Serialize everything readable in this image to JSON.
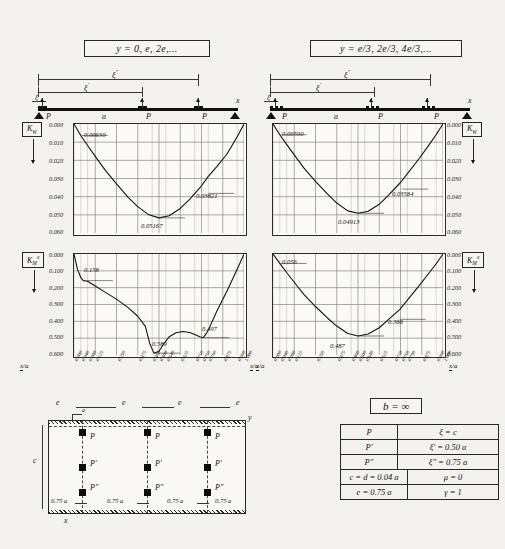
{
  "panels": {
    "left": {
      "title": "y = 0, e, 2e,...",
      "beam_span_label": "a",
      "x_axis_label": "x",
      "dims": [
        "ξ",
        "ξ'",
        "ξ\""
      ],
      "loads": [
        "P",
        "P",
        "P"
      ]
    },
    "right": {
      "title": "y = e/3, 2e/3, 4e/3,...",
      "beam_span_label": "a",
      "x_axis_label": "x",
      "dims": [
        "ξ",
        "ξ'",
        "ξ\""
      ],
      "loads": [
        "P",
        "P",
        "P"
      ]
    }
  },
  "axis": {
    "x_label": "x/a",
    "x_ticks": [
      "0.000",
      "0.040",
      "0.080",
      "0.125",
      "0.250",
      "0.375",
      "0.460",
      "0.500",
      "0.540",
      "0.625",
      "0.710",
      "0.750",
      "0.790",
      "0.875",
      "0.960",
      "1.000"
    ],
    "x_major": [
      "0.125",
      "0.250",
      "0.375",
      "0.500",
      "0.625",
      "0.750",
      "0.875",
      "1.000"
    ],
    "kw_ticks": [
      "0.000",
      "0.010",
      "0.020",
      "0.030",
      "0.040",
      "0.050",
      "0.060"
    ],
    "km_ticks": [
      "0.000",
      "0.100",
      "0.200",
      "0.300",
      "0.400",
      "0.500",
      "0.600"
    ]
  },
  "keys": {
    "kw": "K",
    "kw_sub": "W",
    "km": "K",
    "km_sub": "M",
    "km_sup": "x"
  },
  "chart_data": [
    {
      "type": "line",
      "id": "kw-left",
      "title": "K_W  for  y = 0, e, 2e,...",
      "xlabel": "x/a",
      "ylabel": "K_W",
      "xlim": [
        0.0,
        1.0
      ],
      "ylim": [
        0.0,
        0.06
      ],
      "y_inverted": true,
      "grid": true,
      "annotations": [
        {
          "label": "0.00630",
          "x": 0.045,
          "y": 0.0063
        },
        {
          "label": "0.05167",
          "x": 0.5,
          "y": 0.05167
        },
        {
          "label": "0.03821",
          "x": 0.79,
          "y": 0.03821
        }
      ],
      "x": [
        0.0,
        0.04,
        0.08,
        0.125,
        0.18,
        0.25,
        0.32,
        0.375,
        0.44,
        0.5,
        0.56,
        0.625,
        0.68,
        0.75,
        0.79,
        0.84,
        0.9,
        0.96,
        1.0
      ],
      "values": [
        0.0,
        0.0063,
        0.0118,
        0.0178,
        0.025,
        0.033,
        0.0405,
        0.0455,
        0.05,
        0.05167,
        0.0505,
        0.0465,
        0.0415,
        0.034,
        0.0288,
        0.0235,
        0.0165,
        0.007,
        0.0
      ]
    },
    {
      "type": "line",
      "id": "kw-right",
      "title": "K_W  for  y = e/3, 2e/3, 4e/3,...",
      "xlabel": "x/a",
      "ylabel": "K_W",
      "xlim": [
        0.0,
        1.0
      ],
      "ylim": [
        0.0,
        0.06
      ],
      "y_inverted": true,
      "grid": true,
      "annotations": [
        {
          "label": "0.00590",
          "x": 0.045,
          "y": 0.0059
        },
        {
          "label": "0.04913",
          "x": 0.5,
          "y": 0.04913
        },
        {
          "label": "0.03584",
          "x": 0.76,
          "y": 0.03584
        }
      ],
      "x": [
        0.0,
        0.04,
        0.08,
        0.125,
        0.18,
        0.25,
        0.32,
        0.375,
        0.44,
        0.5,
        0.56,
        0.625,
        0.68,
        0.75,
        0.8,
        0.86,
        0.92,
        0.96,
        1.0
      ],
      "values": [
        0.0,
        0.0059,
        0.0112,
        0.017,
        0.024,
        0.0316,
        0.0385,
        0.0435,
        0.0478,
        0.04913,
        0.048,
        0.0442,
        0.0392,
        0.0322,
        0.0262,
        0.019,
        0.0112,
        0.0058,
        0.0
      ]
    },
    {
      "type": "line",
      "id": "km-left",
      "title": "K_M^x  for  y = 0, e, 2e,...",
      "xlabel": "x/a",
      "ylabel": "K_M^x",
      "xlim": [
        0.0,
        1.0
      ],
      "ylim": [
        0.0,
        0.6
      ],
      "y_inverted": true,
      "grid": true,
      "annotations": [
        {
          "label": "0.158",
          "x": 0.075,
          "y": 0.158
        },
        {
          "label": "0.589",
          "x": 0.47,
          "y": 0.589
        },
        {
          "label": "0.497",
          "x": 0.76,
          "y": 0.497
        }
      ],
      "x": [
        0.0,
        0.02,
        0.04,
        0.055,
        0.08,
        0.125,
        0.18,
        0.25,
        0.32,
        0.375,
        0.42,
        0.445,
        0.47,
        0.5,
        0.53,
        0.56,
        0.6,
        0.64,
        0.68,
        0.71,
        0.74,
        0.76,
        0.78,
        0.8,
        0.84,
        0.9,
        0.96,
        1.0
      ],
      "values": [
        0.0,
        0.09,
        0.14,
        0.158,
        0.162,
        0.19,
        0.225,
        0.268,
        0.32,
        0.37,
        0.43,
        0.53,
        0.589,
        0.578,
        0.53,
        0.492,
        0.468,
        0.46,
        0.466,
        0.478,
        0.492,
        0.497,
        0.47,
        0.43,
        0.34,
        0.22,
        0.09,
        0.0
      ]
    },
    {
      "type": "line",
      "id": "km-right",
      "title": "K_M^x  for  y = e/3, 2e/3, 4e/3,...",
      "xlabel": "x/a",
      "ylabel": "K_M^x",
      "xlim": [
        0.0,
        1.0
      ],
      "ylim": [
        0.0,
        0.6
      ],
      "y_inverted": true,
      "grid": true,
      "annotations": [
        {
          "label": "0.056",
          "x": 0.045,
          "y": 0.056
        },
        {
          "label": "0.487",
          "x": 0.5,
          "y": 0.487
        },
        {
          "label": "0.388",
          "x": 0.745,
          "y": 0.388
        }
      ],
      "x": [
        0.0,
        0.04,
        0.08,
        0.125,
        0.18,
        0.25,
        0.32,
        0.375,
        0.44,
        0.5,
        0.56,
        0.625,
        0.68,
        0.745,
        0.8,
        0.86,
        0.92,
        0.96,
        1.0
      ],
      "values": [
        0.0,
        0.056,
        0.11,
        0.168,
        0.238,
        0.312,
        0.38,
        0.428,
        0.472,
        0.487,
        0.475,
        0.438,
        0.388,
        0.33,
        0.262,
        0.188,
        0.11,
        0.058,
        0.0
      ]
    }
  ],
  "plan": {
    "spacing_labels": [
      "e",
      "e",
      "e",
      "e"
    ],
    "offset_label": "a",
    "side_label": "c",
    "axis_label": "y",
    "bottom_axis_label": "x",
    "dim_labels": [
      "0.75 a",
      "0.75 a",
      "0.75 a",
      "0.75 a"
    ],
    "load_rows": [
      [
        "P",
        "P",
        "P"
      ],
      [
        "P'",
        "P'",
        "P'"
      ],
      [
        "P\"",
        "P\"",
        "P\""
      ]
    ]
  },
  "table": {
    "title": "b = ∞",
    "rows": [
      {
        "sym": "P",
        "val": "ξ = c"
      },
      {
        "sym": "P'",
        "val": "ξ' = 0.50 a"
      },
      {
        "sym": "P\"",
        "val": "ξ\" = 0.75 a"
      }
    ],
    "pairs": [
      {
        "left": "c = d = 0.04 a",
        "right": "μ = 0"
      },
      {
        "left": "e = 0.75 a",
        "right": "γ = 1"
      }
    ]
  }
}
